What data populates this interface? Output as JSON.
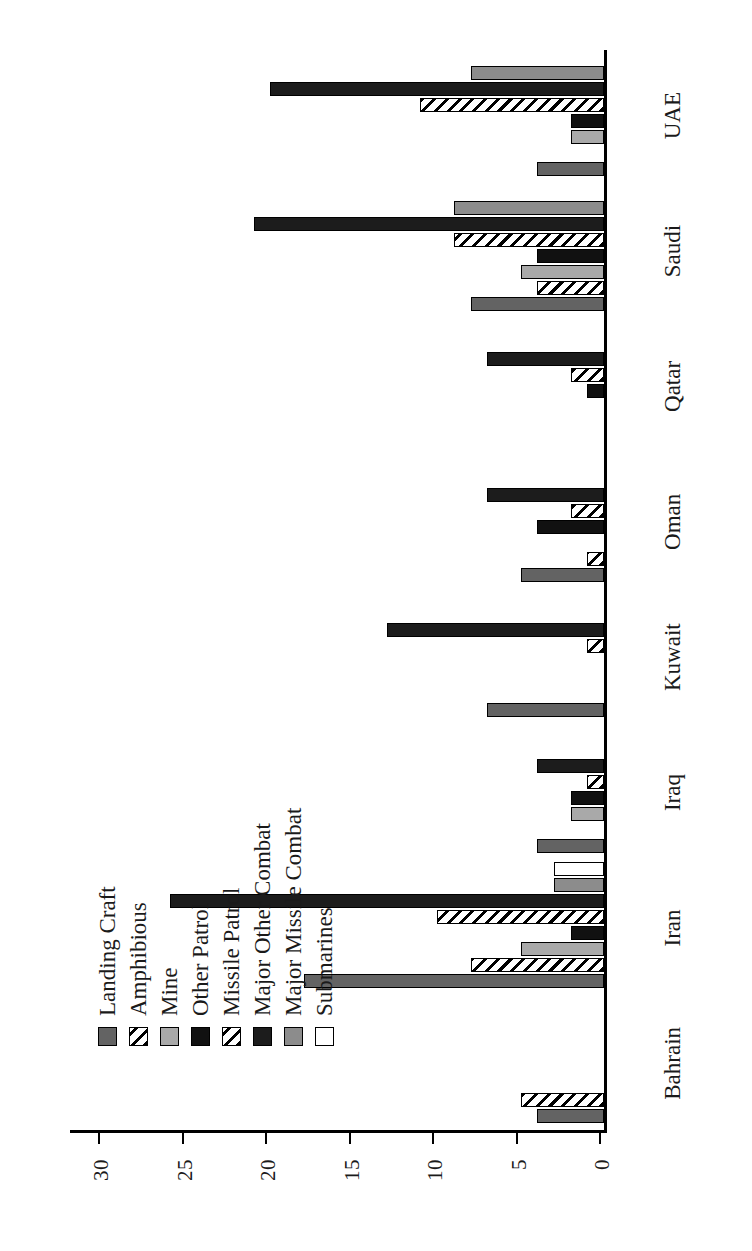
{
  "chart_data": {
    "type": "bar",
    "orientation": "vertical-rotated-90",
    "title": "",
    "xlabel": "",
    "ylabel": "",
    "ylim": [
      0,
      32
    ],
    "yticks": [
      0,
      5,
      10,
      15,
      20,
      25,
      30
    ],
    "ytick_labels": [
      "0",
      "5",
      "10",
      "15",
      "20",
      "25",
      "30"
    ],
    "grid": false,
    "legend_position": "upper-right",
    "categories": [
      "Bahrain",
      "Iran",
      "Iraq",
      "Kuwait",
      "Oman",
      "Qatar",
      "Saudi",
      "UAE"
    ],
    "series": [
      {
        "name": "Landing Craft",
        "swatch": "solid-darkgray",
        "color": "#636363",
        "values": [
          4,
          18,
          4,
          7,
          5,
          0,
          8,
          4
        ]
      },
      {
        "name": "Amphibious",
        "swatch": "diagonal-hatch",
        "color": "#ffffff",
        "values": [
          5,
          8,
          0,
          0,
          1,
          0,
          4,
          0
        ]
      },
      {
        "name": "Mine",
        "swatch": "solid-lightgray",
        "color": "#a9a9a9",
        "values": [
          0,
          5,
          2,
          0,
          0,
          0,
          5,
          2
        ]
      },
      {
        "name": "Other Patrol",
        "swatch": "solid-black",
        "color": "#111111",
        "values": [
          0,
          2,
          2,
          0,
          4,
          1,
          4,
          2
        ]
      },
      {
        "name": "Missile Patrol",
        "swatch": "diagonal-hatch",
        "color": "#ffffff",
        "values": [
          0,
          10,
          1,
          1,
          2,
          2,
          9,
          11
        ]
      },
      {
        "name": "Major Other Combat",
        "swatch": "solid-black",
        "color": "#1c1c1c",
        "values": [
          0,
          26,
          4,
          13,
          7,
          7,
          21,
          20
        ]
      },
      {
        "name": "Major Missile Combat",
        "swatch": "solid-gray",
        "color": "#8c8c8c",
        "values": [
          0,
          3,
          0,
          0,
          0,
          0,
          9,
          8
        ]
      },
      {
        "name": "Submarines",
        "swatch": "white",
        "color": "#ffffff",
        "values": [
          0,
          3,
          0,
          0,
          0,
          0,
          0,
          0
        ]
      }
    ]
  },
  "legend": {
    "items": [
      {
        "label": "Landing Craft",
        "swatch_class": "f-landing"
      },
      {
        "label": "Amphibious",
        "swatch_class": "f-amphib"
      },
      {
        "label": "Mine",
        "swatch_class": "f-mine"
      },
      {
        "label": "Other Patrol",
        "swatch_class": "f-otherpat"
      },
      {
        "label": "Missile Patrol",
        "swatch_class": "f-misspat"
      },
      {
        "label": "Major Other Combat",
        "swatch_class": "f-majother"
      },
      {
        "label": "Major Missile Combat",
        "swatch_class": "f-majmiss"
      },
      {
        "label": "Submarines",
        "swatch_class": "f-sub"
      }
    ]
  }
}
